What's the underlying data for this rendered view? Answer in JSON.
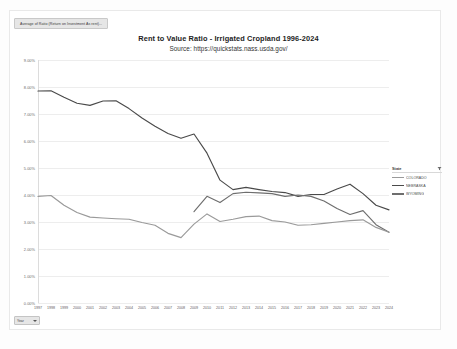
{
  "window": {
    "measure_pill_label": "Average of Ratio (Return on Investment As rent)...",
    "year_filter_label": "Year",
    "year_filter_icon": "chevron-down-icon"
  },
  "header": {
    "title": "Rent to Value Ratio - Irrigated Cropland  1996-2024",
    "subtitle": "Source: https://quickstats.nass.usda.gov/"
  },
  "legend": {
    "title": "State",
    "filter_icon": "filter-icon",
    "entries": [
      {
        "label": "COLORADO",
        "color": "#9a9a9a"
      },
      {
        "label": "NEBRASKA",
        "color": "#4a4a4a"
      },
      {
        "label": "WYOMING",
        "color": "#6e6e6e"
      }
    ]
  },
  "chart_data": {
    "type": "line",
    "title": "Rent to Value Ratio - Irrigated Cropland  1996-2024",
    "subtitle": "Source: https://quickstats.nass.usda.gov/",
    "xlabel": "",
    "ylabel": "",
    "ylim": [
      0,
      9
    ],
    "yticks": [
      "0.00%",
      "1.00%",
      "2.00%",
      "3.00%",
      "4.00%",
      "5.00%",
      "6.00%",
      "7.00%",
      "8.00%",
      "9.00%"
    ],
    "ytick_values": [
      0,
      1,
      2,
      3,
      4,
      5,
      6,
      7,
      8,
      9
    ],
    "grid": true,
    "legend_position": "right",
    "x": [
      "1997",
      "1998",
      "1999",
      "2000",
      "2001",
      "2002",
      "2003",
      "2004",
      "2005",
      "2006",
      "2007",
      "2008",
      "2009",
      "2010",
      "2011",
      "2012",
      "2013",
      "2014",
      "2015",
      "2016",
      "2017",
      "2018",
      "2019",
      "2020",
      "2021",
      "2022",
      "2023",
      "2024"
    ],
    "series": [
      {
        "name": "NEBRASKA",
        "color": "#4a4a4a",
        "values": [
          7.85,
          7.86,
          7.62,
          7.4,
          7.32,
          7.48,
          7.49,
          7.2,
          6.85,
          6.55,
          6.28,
          6.1,
          6.26,
          5.55,
          4.55,
          4.2,
          4.28,
          4.2,
          4.13,
          4.09,
          3.95,
          4.02,
          4.02,
          4.22,
          4.4,
          4.05,
          3.62,
          3.45
        ]
      },
      {
        "name": "WYOMING",
        "color": "#6e6e6e",
        "values": [
          null,
          null,
          null,
          null,
          null,
          null,
          null,
          null,
          null,
          null,
          null,
          null,
          3.38,
          3.95,
          3.72,
          4.05,
          4.1,
          4.08,
          4.05,
          3.95,
          4.0,
          3.95,
          3.78,
          3.5,
          3.28,
          3.42,
          2.9,
          2.62
        ]
      },
      {
        "name": "COLORADO",
        "color": "#9a9a9a",
        "values": [
          3.95,
          3.98,
          3.62,
          3.35,
          3.18,
          3.15,
          3.12,
          3.1,
          2.98,
          2.88,
          2.58,
          2.42,
          2.92,
          3.3,
          3.02,
          3.1,
          3.2,
          3.22,
          3.05,
          3.0,
          2.88,
          2.9,
          2.95,
          3.0,
          3.05,
          3.08,
          2.8,
          2.62
        ]
      }
    ]
  }
}
